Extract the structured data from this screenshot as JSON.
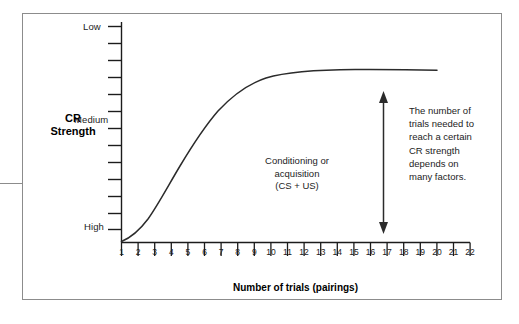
{
  "figure": {
    "frame_color": "#8c8c8c",
    "y_axis_title": "CR\nStrength",
    "y_axis_title_line1": "CR",
    "y_axis_title_line2": "Strength",
    "x_axis_title": "Number of trials (pairings)",
    "y_tick_labels": [
      "High",
      "Medium",
      "Low"
    ],
    "annotation_center_lines": [
      "Conditioning or",
      "acquisition",
      "(CS + US)"
    ],
    "annotation_right": "The number of trials needed to reach a certain CR strength depends on many factors.",
    "annotation_right_lines": [
      "The number of",
      "trials needed to",
      "reach a certain",
      "CR strength",
      "depends on",
      "many factors."
    ]
  },
  "chart_data": {
    "type": "line",
    "title": "",
    "xlabel": "Number of trials (pairings)",
    "ylabel": "CR Strength",
    "xlim": [
      1,
      22
    ],
    "ylim": [
      0,
      13
    ],
    "grid": false,
    "legend": null,
    "x_tick_labels": [
      "1",
      "2",
      "3",
      "4",
      "5",
      "6",
      "7",
      "8",
      "9",
      "10",
      "11",
      "12",
      "13",
      "14",
      "15",
      "16",
      "17",
      "18",
      "19",
      "20",
      "21",
      "22"
    ],
    "x_ticks": [
      1,
      2,
      3,
      4,
      5,
      6,
      7,
      8,
      9,
      10,
      11,
      12,
      13,
      14,
      15,
      16,
      17,
      18,
      19,
      20,
      21,
      22
    ],
    "y_tick_count": 13,
    "y_named_ticks": [
      {
        "label": "Low",
        "value": 1
      },
      {
        "label": "Medium",
        "value": 7
      },
      {
        "label": "High",
        "value": 13
      }
    ],
    "series": [
      {
        "name": "Acquisition curve (CR strength)",
        "shape": "sigmoid / S-shaped learning curve",
        "x": [
          1,
          2,
          3,
          4,
          5,
          6,
          7,
          8,
          9,
          10,
          11,
          12,
          13,
          14,
          15,
          16,
          17,
          18,
          19
        ],
        "values": [
          1.0,
          1.3,
          2.0,
          3.1,
          4.5,
          6.0,
          7.4,
          8.6,
          9.6,
          10.4,
          11.0,
          11.4,
          11.7,
          11.9,
          12.0,
          12.1,
          12.15,
          12.2,
          12.2
        ]
      }
    ],
    "annotations": [
      {
        "name": "conditioning-label",
        "text": "Conditioning or acquisition (CS + US)",
        "x": 12.5,
        "y": 4.5
      },
      {
        "name": "trials-needed-note",
        "text": "The number of trials needed to reach a certain CR strength depends on many factors.",
        "x": 21,
        "y": 8
      },
      {
        "name": "cr-strength-range-arrow",
        "type": "double-headed-vertical-arrow",
        "x": 17.1,
        "y_from": 1.1,
        "y_to": 9.7
      }
    ]
  }
}
